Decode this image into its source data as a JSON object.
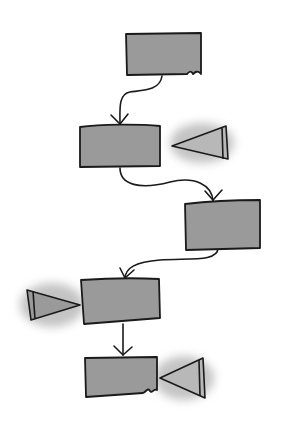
{
  "diagram": {
    "type": "hand-drawn flowchart",
    "colors": {
      "background": "#ffffff",
      "box_fill": "#9a9a9a",
      "triangle_fill": "#b8b8b8",
      "stroke": "#1a1a1a",
      "shadow": "#888888"
    },
    "boxes": [
      {
        "id": "box-1",
        "x": 127,
        "y": 34,
        "w": 75,
        "h": 42
      },
      {
        "id": "box-2",
        "x": 80,
        "y": 125,
        "w": 80,
        "h": 43
      },
      {
        "id": "box-3",
        "x": 185,
        "y": 200,
        "w": 75,
        "h": 48
      },
      {
        "id": "box-4",
        "x": 82,
        "y": 278,
        "w": 77,
        "h": 46
      },
      {
        "id": "box-5",
        "x": 85,
        "y": 355,
        "w": 72,
        "h": 42
      }
    ],
    "triangles": [
      {
        "id": "triangle-1",
        "side": "right-of-box-2"
      },
      {
        "id": "triangle-2",
        "side": "left-of-box-4"
      },
      {
        "id": "triangle-3",
        "side": "right-of-box-5"
      }
    ],
    "connectors": [
      {
        "from": "box-1",
        "to": "box-2"
      },
      {
        "from": "box-2",
        "to": "box-3"
      },
      {
        "from": "box-3",
        "to": "box-4"
      },
      {
        "from": "box-4",
        "to": "box-5"
      }
    ]
  }
}
